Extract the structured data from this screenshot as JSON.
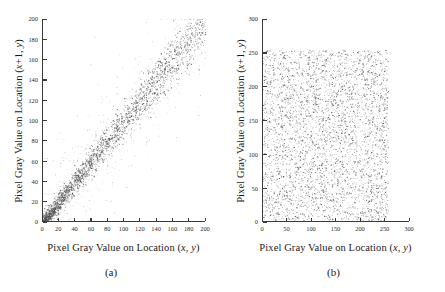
{
  "figure": {
    "background_color": "#ffffff",
    "ink_color": "#3a3a3a",
    "point_color": "#4d4d4d"
  },
  "panels": [
    {
      "id": "a",
      "caption": "(a)",
      "xlabel": "Pixel Gray Value on Location (x, y)",
      "ylabel": "Pixel Gray Value on Location (x+1, y)"
    },
    {
      "id": "b",
      "caption": "(b)",
      "xlabel": "Pixel Gray Value on Location (x, y)",
      "ylabel": "Pixel Gray Value on Location (x+1, y)"
    }
  ],
  "chart_data": [
    {
      "type": "scatter",
      "panel": "a",
      "title": "(a)",
      "xlabel": "Pixel Gray Value on Location (x, y)",
      "ylabel": "Pixel Gray Value on Location (x+1, y)",
      "xlim": [
        0,
        200
      ],
      "ylim": [
        0,
        200
      ],
      "xticks": [
        0,
        20,
        40,
        60,
        80,
        100,
        120,
        140,
        160,
        180,
        200
      ],
      "yticks": [
        0,
        20,
        40,
        60,
        80,
        100,
        120,
        140,
        160,
        180,
        200
      ],
      "xticklabels": [
        "0",
        "20",
        "40",
        "60",
        "80",
        "100",
        "120",
        "140",
        "160",
        "180",
        "200"
      ],
      "yticklabels": [
        "0",
        "20",
        "40",
        "60",
        "80",
        "100",
        "120",
        "140",
        "160",
        "180",
        "200"
      ],
      "grid": false,
      "legend": "none",
      "marker": "dot",
      "description": "Dense point cloud concentrated along the y = x diagonal, indicating strong correlation between adjacent pixel gray values in the plain image. Heaviest clustering between 0 and 60, with a broadening band up to ~140 and sparse outliers up to 200.",
      "n_points": 2600,
      "correlation": 0.96,
      "distribution": "diagonal-band",
      "diagonal_sigma": 9,
      "value_range": [
        0,
        200
      ]
    },
    {
      "type": "scatter",
      "panel": "b",
      "title": "(b)",
      "xlabel": "Pixel Gray Value on Location (x, y)",
      "ylabel": "Pixel Gray Value on Location (x+1, y)",
      "xlim": [
        0,
        300
      ],
      "ylim": [
        0,
        300
      ],
      "xticks": [
        0,
        50,
        100,
        150,
        200,
        250,
        300
      ],
      "yticks": [
        0,
        50,
        100,
        150,
        200,
        250,
        300
      ],
      "xticklabels": [
        "0",
        "50",
        "100",
        "150",
        "200",
        "250",
        "300"
      ],
      "yticklabels": [
        "0",
        "50",
        "100",
        "150",
        "200",
        "250",
        "300"
      ],
      "grid": false,
      "legend": "none",
      "marker": "dot",
      "description": "Uniformly random point cloud filling the square region 0-255 in both axes, indicating no correlation between adjacent pixel gray values in the encrypted image.",
      "n_points": 4200,
      "correlation": 0.0,
      "distribution": "uniform",
      "value_range": [
        0,
        255
      ]
    }
  ]
}
